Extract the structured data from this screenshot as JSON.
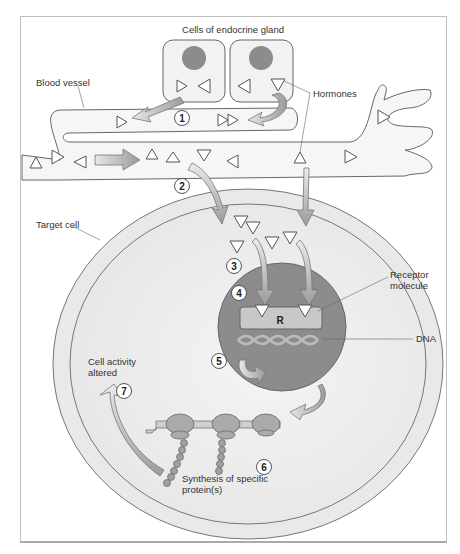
{
  "diagram": {
    "title": "Cells of endocrine gland",
    "labels": {
      "blood_vessel": "Blood vessel",
      "hormones": "Hormones",
      "target_cell": "Target cell",
      "receptor_line1": "Receptor",
      "receptor_line2": "molecule",
      "receptor_symbol": "R",
      "dna": "DNA",
      "cell_activity_line1": "Cell activity",
      "cell_activity_line2": "altered",
      "synthesis_line1": "Synthesis of specific",
      "synthesis_line2": "protein(s)"
    },
    "steps": [
      "1",
      "2",
      "3",
      "4",
      "5",
      "6",
      "7"
    ],
    "colors": {
      "nucleus": "#8c8c8c",
      "cell_fill": "#efefef",
      "membrane": "#e4e4e4",
      "arrow": "#a9a9a9",
      "outline": "#555555",
      "receptor": "#c8c8c8"
    }
  }
}
